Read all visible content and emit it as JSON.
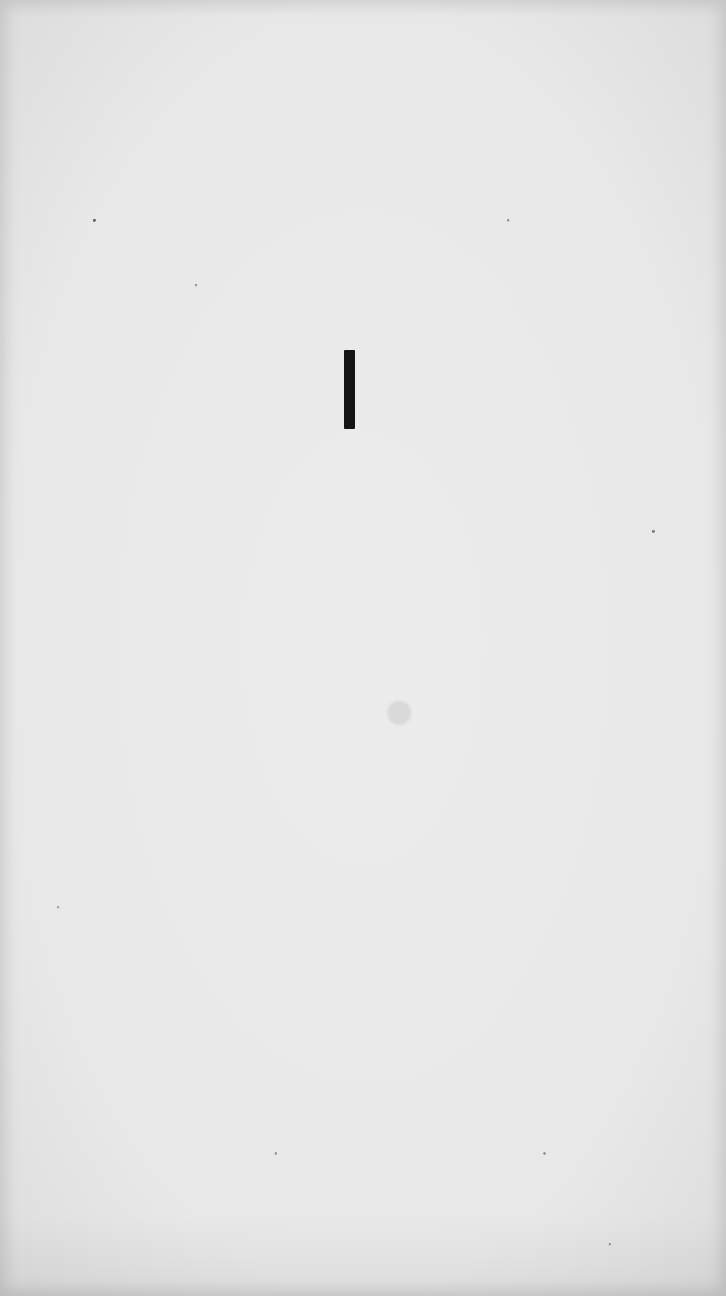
{
  "page": {
    "background_color": "#e6e6e6",
    "mark": {
      "text": "I",
      "color": "#141414"
    }
  }
}
